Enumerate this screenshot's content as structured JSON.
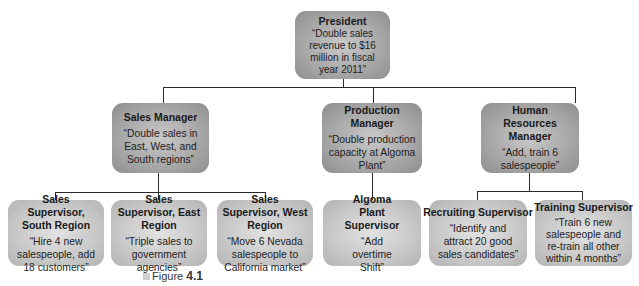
{
  "diagram": {
    "type": "organizational-chart",
    "president": {
      "title": "President",
      "goal": "“Double sales revenue to $16 million in fiscal year 2011”"
    },
    "managers": [
      {
        "title": "Sales Manager",
        "goal": "“Double sales in East, West, and South regions”"
      },
      {
        "title": "Production Manager",
        "goal": "“Double production capacity at Algoma Plant”"
      },
      {
        "title": "Human Resources Manager",
        "goal": "“Add, train 6 salespeople”"
      }
    ],
    "supervisors": [
      {
        "title": "Sales Supervisor, South Region",
        "goal": "“Hire 4 new salespeople, add 18 customers”",
        "reports_to": "Sales Manager"
      },
      {
        "title": "Sales Supervisor, East Region",
        "goal": "“Triple sales to government agencies”",
        "reports_to": "Sales Manager"
      },
      {
        "title": "Sales Supervisor, West Region",
        "goal": "“Move 6 Nevada salespeople to California market”",
        "reports_to": "Sales Manager"
      },
      {
        "title": "Algoma Plant Supervisor",
        "goal": "“Add overtime Shift”",
        "reports_to": "Production Manager"
      },
      {
        "title": "Recruiting Supervisor",
        "goal": "“Identify and attract 20 good sales candidates”",
        "reports_to": "Human Resources Manager"
      },
      {
        "title": "Training Supervisor",
        "goal": "“Train 6 new salespeople and re-train all other within 4 months”",
        "reports_to": "Human Resources Manager"
      }
    ]
  },
  "caption": {
    "prefix": "Figure",
    "number": "4.1"
  },
  "colors": {
    "president_box": "#a9a9a9",
    "manager_box": "#a9a9a9",
    "supervisor_box": "#cacaca",
    "connector": "#2a2a2a"
  }
}
